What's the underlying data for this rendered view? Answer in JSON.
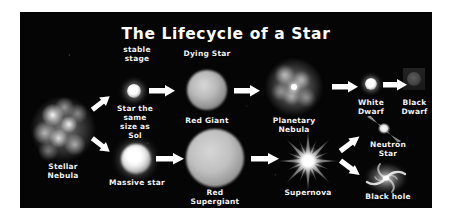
{
  "diagram": {
    "title": "The Lifecycle of a Star",
    "background_color": "#050505",
    "page_background": "#ffffff",
    "text_color": "#f2f2f2",
    "arrow_color": "#ffffff"
  },
  "stages": {
    "stellar_nebula": "Stellar\nNebula",
    "stable_stage": "stable\nstage",
    "sun_like_star": "Star the\nsame\nsize as\nSol",
    "dying_star": "Dying Star",
    "red_giant": "Red Giant",
    "planetary_nebula": "Planetary\nNebula",
    "white_dwarf": "White\nDwarf",
    "black_dwarf": "Black\nDwarf",
    "massive_star": "Massive star",
    "red_supergiant": "Red\nSupergiant",
    "supernova": "Supernova",
    "neutron_star": "Neutron\nStar",
    "black_hole": "Black hole"
  },
  "icons": {
    "stellar_nebula": "nebula-cloud-icon",
    "main_sequence_star": "small-star-icon",
    "red_giant": "red-giant-sphere-icon",
    "planetary_nebula": "planetary-nebula-icon",
    "white_dwarf": "white-dwarf-icon",
    "black_dwarf": "black-dwarf-icon",
    "massive_star": "massive-star-icon",
    "red_supergiant": "red-supergiant-sphere-icon",
    "supernova": "supernova-burst-icon",
    "neutron_star": "pulsar-icon",
    "black_hole": "black-hole-spiral-icon",
    "flow": "arrow-right-icon"
  }
}
